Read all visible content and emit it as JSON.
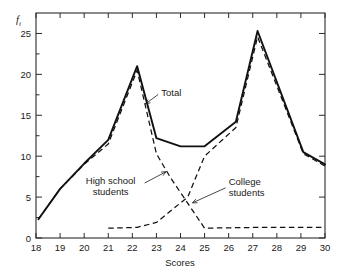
{
  "chart_data": {
    "type": "line",
    "title": "",
    "subtitle": "",
    "xlabel": "Scores",
    "ylabel": "f_i",
    "ylabel_display": "f",
    "ylabel_subscript": "i",
    "xlim": [
      18,
      30
    ],
    "ylim": [
      0,
      27.5
    ],
    "xticks": [
      18,
      19,
      20,
      21,
      22,
      23,
      24,
      25,
      26,
      27,
      28,
      29,
      30
    ],
    "yticks": [
      0,
      5,
      10,
      15,
      20,
      25
    ],
    "xtick_labels": [
      "18",
      "19",
      "20",
      "21",
      "22",
      "23",
      "24",
      "25",
      "26",
      "27",
      "28",
      "29",
      "30"
    ],
    "ytick_labels": [
      "0",
      "5",
      "10",
      "15",
      "20",
      "25"
    ],
    "grid": false,
    "legend": "none",
    "legend_position": "inline-annotations",
    "frame": "box",
    "tick_direction": "in",
    "series": [
      {
        "name": "Total",
        "style": "solid",
        "color": "#111111",
        "x": [
          18.1,
          19.0,
          20.0,
          21.0,
          22.2,
          23.0,
          24.0,
          25.0,
          26.3,
          27.2,
          29.1,
          30.0
        ],
        "values": [
          2.3,
          6.0,
          9.1,
          12.0,
          21.0,
          12.2,
          11.2,
          11.2,
          14.2,
          25.3,
          10.5,
          9.0
        ]
      },
      {
        "name": "High school students",
        "style": "dashed",
        "color": "#111111",
        "x": [
          18.1,
          19.0,
          20.0,
          21.0,
          22.2,
          23.0,
          23.6,
          25.0,
          27.3,
          30.0
        ],
        "values": [
          2.3,
          6.0,
          9.0,
          11.5,
          20.5,
          10.3,
          7.3,
          1.2,
          1.3,
          1.3
        ]
      },
      {
        "name": "College students",
        "style": "dashed",
        "color": "#111111",
        "x": [
          21.0,
          22.2,
          23.0,
          24.3,
          25.0,
          26.3,
          27.2,
          29.1,
          30.0
        ],
        "values": [
          1.2,
          1.3,
          1.9,
          5.0,
          10.0,
          13.5,
          24.6,
          10.3,
          8.8
        ]
      }
    ],
    "annotations": [
      {
        "id": "total",
        "text": "Total",
        "text_lines": [
          "Total"
        ],
        "points_to": {
          "x": 22.55,
          "y": 16.4
        },
        "label_at": {
          "x": 23.2,
          "y": 17.3
        }
      },
      {
        "id": "high-school-students",
        "text": "High school students",
        "text_lines": [
          "High school",
          "students"
        ],
        "points_to": {
          "x": 23.4,
          "y": 8.1
        },
        "label_at": {
          "x": 21.1,
          "y": 6.6
        }
      },
      {
        "id": "college-students",
        "text": "College students",
        "text_lines": [
          "College",
          "students"
        ],
        "points_to": {
          "x": 24.5,
          "y": 4.3
        },
        "label_at": {
          "x": 26.0,
          "y": 6.5
        }
      }
    ]
  }
}
